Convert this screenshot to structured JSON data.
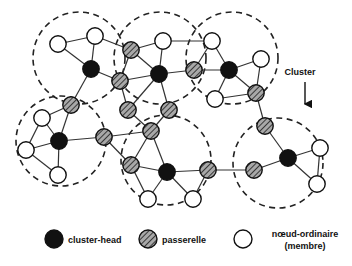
{
  "figure": {
    "type": "network-diagram",
    "title": "",
    "background_color": "#ffffff",
    "line_color": "#222222",
    "annotation": {
      "label": "Cluster",
      "x": 300,
      "y": 75,
      "arrow_from": [
        305,
        82
      ],
      "arrow_to": [
        305,
        104
      ]
    }
  },
  "colors": {
    "cluster_head_fill": "#111111",
    "gateway_fill": "#a8a8a8",
    "gateway_hatch": "#2b2b2b",
    "member_fill": "#ffffff",
    "node_stroke": "#111111",
    "edge_stroke": "#333333",
    "cluster_boundary": "#222222"
  },
  "legend": {
    "items": [
      {
        "key": "cluster-head",
        "label": "cluster-head",
        "shape": "filled-circle",
        "cx": 54,
        "cy": 239
      },
      {
        "key": "passerelle",
        "label": "passerelle",
        "shape": "hatched-circle",
        "cx": 148,
        "cy": 239
      },
      {
        "key": "noeud-ordinaire",
        "label": "nœud-ordinaire",
        "label_line2": "(membre)",
        "shape": "empty-circle",
        "cx": 243,
        "cy": 239
      }
    ]
  },
  "clusters": [
    {
      "id": "c1",
      "cx": 79,
      "cy": 58,
      "r": 46
    },
    {
      "id": "c2",
      "cx": 160,
      "cy": 58,
      "r": 46
    },
    {
      "id": "c3",
      "cx": 232,
      "cy": 58,
      "r": 46
    },
    {
      "id": "c4",
      "cx": 61,
      "cy": 141,
      "r": 45
    },
    {
      "id": "c5",
      "cx": 166,
      "cy": 160,
      "r": 45
    },
    {
      "id": "c6",
      "cx": 278,
      "cy": 163,
      "r": 45
    }
  ],
  "nodes": [
    {
      "id": "n1",
      "type": "member",
      "x": 58,
      "y": 44
    },
    {
      "id": "n2",
      "type": "member",
      "x": 95,
      "y": 36
    },
    {
      "id": "n3",
      "type": "cluster-head",
      "x": 91,
      "y": 69
    },
    {
      "id": "n4",
      "type": "gateway",
      "x": 71,
      "y": 105
    },
    {
      "id": "n5",
      "type": "gateway",
      "x": 131,
      "y": 50
    },
    {
      "id": "n6",
      "type": "gateway",
      "x": 120,
      "y": 81
    },
    {
      "id": "n7",
      "type": "member",
      "x": 163,
      "y": 41
    },
    {
      "id": "n8",
      "type": "cluster-head",
      "x": 159,
      "y": 74
    },
    {
      "id": "n9",
      "type": "gateway",
      "x": 194,
      "y": 70
    },
    {
      "id": "n10",
      "type": "gateway",
      "x": 128,
      "y": 110
    },
    {
      "id": "n11",
      "type": "gateway",
      "x": 169,
      "y": 110
    },
    {
      "id": "n12",
      "type": "member",
      "x": 212,
      "y": 41
    },
    {
      "id": "n13",
      "type": "cluster-head",
      "x": 229,
      "y": 70
    },
    {
      "id": "n14",
      "type": "member",
      "x": 261,
      "y": 59
    },
    {
      "id": "n15",
      "type": "member",
      "x": 215,
      "y": 99
    },
    {
      "id": "n16",
      "type": "gateway",
      "x": 256,
      "y": 93
    },
    {
      "id": "n17",
      "type": "member",
      "x": 42,
      "y": 118
    },
    {
      "id": "n18",
      "type": "cluster-head",
      "x": 59,
      "y": 141
    },
    {
      "id": "n19",
      "type": "member",
      "x": 26,
      "y": 150
    },
    {
      "id": "n20",
      "type": "member",
      "x": 58,
      "y": 175
    },
    {
      "id": "n21",
      "type": "gateway",
      "x": 104,
      "y": 137
    },
    {
      "id": "n22",
      "type": "gateway",
      "x": 151,
      "y": 131
    },
    {
      "id": "n23",
      "type": "gateway",
      "x": 131,
      "y": 165
    },
    {
      "id": "n24",
      "type": "cluster-head",
      "x": 167,
      "y": 172
    },
    {
      "id": "n25",
      "type": "member",
      "x": 148,
      "y": 199
    },
    {
      "id": "n26",
      "type": "member",
      "x": 193,
      "y": 199
    },
    {
      "id": "n27",
      "type": "gateway",
      "x": 208,
      "y": 170
    },
    {
      "id": "n28",
      "type": "gateway",
      "x": 254,
      "y": 170
    },
    {
      "id": "n29",
      "type": "gateway",
      "x": 265,
      "y": 126
    },
    {
      "id": "n30",
      "type": "cluster-head",
      "x": 288,
      "y": 158
    },
    {
      "id": "n31",
      "type": "member",
      "x": 320,
      "y": 148
    },
    {
      "id": "n32",
      "type": "member",
      "x": 317,
      "y": 184
    }
  ],
  "edges": [
    [
      "n1",
      "n2"
    ],
    [
      "n1",
      "n3"
    ],
    [
      "n2",
      "n3"
    ],
    [
      "n3",
      "n4"
    ],
    [
      "n3",
      "n6"
    ],
    [
      "n2",
      "n5"
    ],
    [
      "n5",
      "n6"
    ],
    [
      "n5",
      "n7"
    ],
    [
      "n5",
      "n8"
    ],
    [
      "n6",
      "n8"
    ],
    [
      "n7",
      "n8"
    ],
    [
      "n8",
      "n9"
    ],
    [
      "n8",
      "n10"
    ],
    [
      "n8",
      "n11"
    ],
    [
      "n6",
      "n10"
    ],
    [
      "n9",
      "n13"
    ],
    [
      "n12",
      "n13"
    ],
    [
      "n12",
      "n7"
    ],
    [
      "n13",
      "n14"
    ],
    [
      "n13",
      "n15"
    ],
    [
      "n13",
      "n16"
    ],
    [
      "n14",
      "n16"
    ],
    [
      "n15",
      "n16"
    ],
    [
      "n9",
      "n12"
    ],
    [
      "n17",
      "n18"
    ],
    [
      "n18",
      "n19"
    ],
    [
      "n18",
      "n20"
    ],
    [
      "n17",
      "n19"
    ],
    [
      "n19",
      "n20"
    ],
    [
      "n4",
      "n17"
    ],
    [
      "n4",
      "n18"
    ],
    [
      "n18",
      "n21"
    ],
    [
      "n21",
      "n22"
    ],
    [
      "n21",
      "n23"
    ],
    [
      "n10",
      "n22"
    ],
    [
      "n11",
      "n22"
    ],
    [
      "n22",
      "n23"
    ],
    [
      "n22",
      "n24"
    ],
    [
      "n23",
      "n24"
    ],
    [
      "n23",
      "n25"
    ],
    [
      "n24",
      "n25"
    ],
    [
      "n24",
      "n26"
    ],
    [
      "n24",
      "n27"
    ],
    [
      "n26",
      "n27"
    ],
    [
      "n27",
      "n28"
    ],
    [
      "n28",
      "n30"
    ],
    [
      "n16",
      "n29"
    ],
    [
      "n29",
      "n30"
    ],
    [
      "n30",
      "n31"
    ],
    [
      "n30",
      "n32"
    ],
    [
      "n31",
      "n32"
    ]
  ]
}
